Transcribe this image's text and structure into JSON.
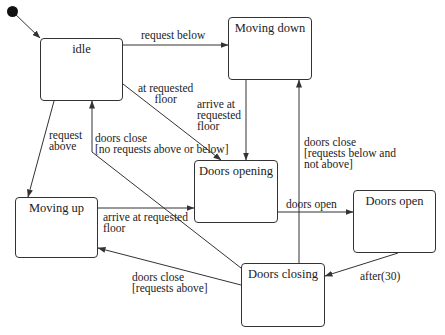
{
  "diagram": {
    "type": "state-machine",
    "initial_state": "idle",
    "states": [
      {
        "id": "idle",
        "label": "idle"
      },
      {
        "id": "moving_down",
        "label": "Moving down"
      },
      {
        "id": "moving_up",
        "label": "Moving up"
      },
      {
        "id": "doors_opening",
        "label": "Doors opening"
      },
      {
        "id": "doors_open",
        "label": "Doors open"
      },
      {
        "id": "doors_closing",
        "label": "Doors closing"
      }
    ],
    "transitions": [
      {
        "from": "idle",
        "to": "moving_down",
        "label": "request below"
      },
      {
        "from": "idle",
        "to": "moving_up",
        "label_lines": [
          "request",
          "above"
        ]
      },
      {
        "from": "idle",
        "to": "doors_opening",
        "label_lines": [
          "at requested",
          "floor"
        ]
      },
      {
        "from": "moving_down",
        "to": "doors_opening",
        "label_lines": [
          "arrive at",
          "requested",
          "floor"
        ]
      },
      {
        "from": "moving_up",
        "to": "doors_opening",
        "label_lines": [
          "arrive at requested",
          "floor"
        ]
      },
      {
        "from": "doors_opening",
        "to": "doors_open",
        "label": "doors open"
      },
      {
        "from": "doors_open",
        "to": "doors_closing",
        "label": "after(30)"
      },
      {
        "from": "doors_closing",
        "to": "idle",
        "label_lines": [
          "doors close",
          "[no requests above or below]"
        ]
      },
      {
        "from": "doors_closing",
        "to": "moving_down",
        "label_lines": [
          "doors close",
          "[requests below and",
          "not above]"
        ]
      },
      {
        "from": "doors_closing",
        "to": "moving_up",
        "label_lines": [
          "doors close",
          "[requests above]"
        ]
      }
    ]
  }
}
